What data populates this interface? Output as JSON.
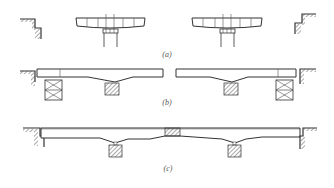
{
  "diagram": {
    "type": "bridge-construction-stages",
    "colors": {
      "line": "#333333",
      "hatch": "#555555",
      "background": "#ffffff"
    },
    "panels": [
      {
        "id": "a",
        "caption": "(a)",
        "description": "Balanced cantilever segments on piers, abutments separate"
      },
      {
        "id": "b",
        "caption": "(b)",
        "description": "Side spans completed on scaffolding falsework, gap at midspan"
      },
      {
        "id": "c",
        "caption": "(c)",
        "description": "Continuous girder closed with midspan closure segment"
      }
    ]
  }
}
